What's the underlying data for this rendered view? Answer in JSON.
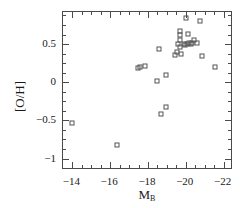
{
  "chart_data": {
    "type": "scatter",
    "title": "",
    "xlabel": "M_B",
    "xlabel_base": "M",
    "xlabel_sub": "B",
    "ylabel": "[O/H]",
    "xlim": [
      -13.5,
      -22.5
    ],
    "ylim": [
      -1.15,
      0.92
    ],
    "x_ticks": [
      -14,
      -16,
      -18,
      -20,
      -22
    ],
    "x_tick_labels": [
      "−14",
      "−16",
      "−18",
      "−20",
      "−22"
    ],
    "y_ticks": [
      0.5,
      0,
      -0.5,
      -1
    ],
    "y_tick_labels": [
      "0.5",
      "0",
      "−0.5",
      "−1"
    ],
    "x_minor_step": 0.5,
    "y_minor_step": 0.125,
    "grid": false,
    "legend": null,
    "marker": "open-square",
    "marker_color": "#555555",
    "axes_color": "#4a4a4a",
    "background": "#ffffff",
    "series": [
      {
        "name": "galaxies",
        "points": [
          [
            -13.95,
            -0.54
          ],
          [
            -16.35,
            -0.82
          ],
          [
            -18.45,
            0.01
          ],
          [
            -17.85,
            0.21
          ],
          [
            -17.55,
            0.2
          ],
          [
            -17.45,
            0.18
          ],
          [
            -18.95,
            0.09
          ],
          [
            -18.95,
            -0.32
          ],
          [
            -18.7,
            -0.41
          ],
          [
            -18.6,
            0.44
          ],
          [
            -19.55,
            0.39
          ],
          [
            -19.45,
            0.36
          ],
          [
            -19.75,
            0.37
          ],
          [
            -19.7,
            0.46
          ],
          [
            -19.6,
            0.5
          ],
          [
            -19.7,
            0.55
          ],
          [
            -19.72,
            0.62
          ],
          [
            -19.72,
            0.67
          ],
          [
            -19.9,
            0.5
          ],
          [
            -19.95,
            0.49
          ],
          [
            -20.05,
            0.5
          ],
          [
            -20.15,
            0.51
          ],
          [
            -20.25,
            0.5
          ],
          [
            -20.35,
            0.52
          ],
          [
            -20.45,
            0.55
          ],
          [
            -20.1,
            0.63
          ],
          [
            -20.0,
            0.84
          ],
          [
            -20.6,
            0.52
          ],
          [
            -20.75,
            0.8
          ],
          [
            -20.85,
            0.35
          ],
          [
            -21.55,
            0.2
          ]
        ]
      }
    ]
  }
}
